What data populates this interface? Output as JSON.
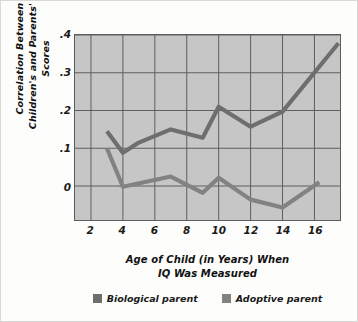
{
  "chart_data": {
    "type": "line",
    "title": "",
    "xlabel": "Age of Child (in Years) When IQ Was Measured",
    "ylabel": "Correlation Between Children's and Parents' IQ Scores",
    "xlim": [
      1,
      17.6
    ],
    "ylim": [
      -0.09,
      0.4
    ],
    "xticks": [
      2,
      4,
      6,
      8,
      10,
      12,
      14,
      16
    ],
    "xtick_labels": [
      "2",
      "4",
      "6",
      "8",
      "10",
      "12",
      "14",
      "16"
    ],
    "yticks": [
      0,
      0.1,
      0.2,
      0.3,
      0.4
    ],
    "ytick_labels": [
      "0",
      ".1",
      ".2",
      ".3",
      ".4"
    ],
    "grid": true,
    "legend_position": "bottom",
    "plot_bgcolor": "#c6c6c6",
    "series": [
      {
        "name": "Biological parent",
        "color": "#6e6e6e",
        "x": [
          3,
          4,
          5,
          7,
          9,
          10,
          12,
          14,
          17.5
        ],
        "values": [
          0.145,
          0.088,
          0.115,
          0.15,
          0.128,
          0.21,
          0.157,
          0.197,
          0.378
        ]
      },
      {
        "name": "Adoptive parent",
        "color": "#828282",
        "x": [
          3,
          4,
          7,
          9,
          10,
          12,
          14,
          16.3
        ],
        "values": [
          0.1,
          -0.002,
          0.025,
          -0.018,
          0.022,
          -0.036,
          -0.057,
          0.01
        ]
      }
    ]
  },
  "axes": {
    "y_title_lines": [
      "Correlation Between",
      "Children's and Parents' IQ Scores"
    ],
    "x_title_lines": [
      "Age of Child (in Years) When",
      "IQ Was Measured"
    ]
  },
  "legend": {
    "items": [
      {
        "label": "Biological parent",
        "color": "#6e6e6e"
      },
      {
        "label": "Adoptive parent",
        "color": "#828282"
      }
    ]
  },
  "colors": {
    "figure_background": "#fdfdfc",
    "plot_background": "#c6c6c6",
    "grid_line": "#5d5d5d",
    "axis_line": "#5d5d5d",
    "text": "#1a1a1a",
    "border": "#d8d8d4"
  }
}
